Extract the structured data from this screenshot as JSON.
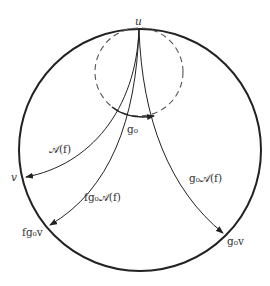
{
  "diagram": {
    "type": "hyperbolic-disk",
    "colors": {
      "stroke": "#222222",
      "text": "#333333",
      "background": "#ffffff"
    },
    "outer_circle": {
      "cx": 140,
      "cy": 150,
      "r": 121
    },
    "dashed_circle": {
      "cx": 139,
      "cy": 72,
      "r": 44
    },
    "points": {
      "u": "u",
      "v": "v",
      "fg0v": "fg₀v",
      "g0v": "g₀v"
    },
    "arrows": {
      "A_f": "𝒜(f)",
      "fg0_A_f": "fg₀𝒜(f)",
      "g0_A_f": "g₀𝒜(f)",
      "g0": "g₀"
    }
  }
}
